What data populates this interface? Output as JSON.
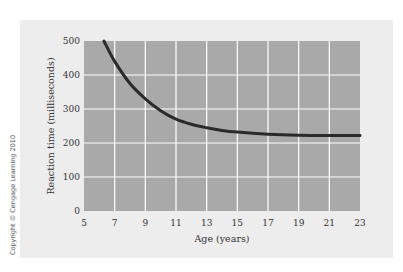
{
  "chart_data": {
    "type": "line",
    "title": "",
    "xlabel": "Age (years)",
    "ylabel": "Reaction time (milliseconds)",
    "xlim": [
      5,
      23
    ],
    "ylim": [
      0,
      500
    ],
    "xticks": [
      5,
      7,
      9,
      11,
      13,
      15,
      17,
      19,
      21,
      23
    ],
    "yticks": [
      0,
      100,
      200,
      300,
      400,
      500
    ],
    "grid": true,
    "legend": null,
    "series": [
      {
        "name": "Reaction time",
        "x": [
          6.3,
          7,
          8,
          9,
          10,
          11,
          12,
          13,
          14,
          15,
          17,
          19,
          21,
          23
        ],
        "y": [
          500,
          440,
          375,
          330,
          295,
          270,
          255,
          245,
          237,
          232,
          226,
          223,
          222,
          222
        ]
      }
    ],
    "colors": {
      "plot_bg": "#a9a9a9",
      "grid": "#ffffff",
      "line": "#2a2a2a",
      "panel_bg": "#ededed"
    }
  },
  "labels": {
    "xlabel": "Age (years)",
    "ylabel": "Reaction time (milliseconds)",
    "copyright": "Copyright © Cengage Learning 2010"
  }
}
